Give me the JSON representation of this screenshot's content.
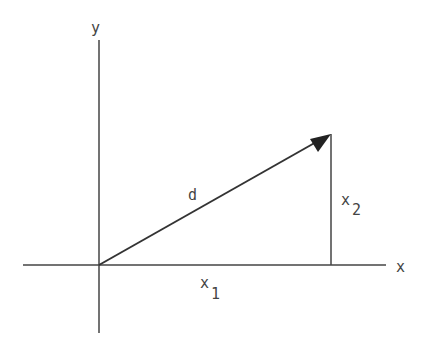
{
  "diagram": {
    "type": "vector-decomposition",
    "axes": {
      "x_label": "x",
      "y_label": "y"
    },
    "vector": {
      "label": "d",
      "from": [
        0,
        0
      ],
      "to": [
        "x1",
        "x2"
      ]
    },
    "components": {
      "horizontal_label_base": "x",
      "horizontal_label_sub": "1",
      "vertical_label_base": "x",
      "vertical_label_sub": "2"
    },
    "colors": {
      "line": "#333333",
      "text": "#444444",
      "background": "#ffffff"
    }
  }
}
